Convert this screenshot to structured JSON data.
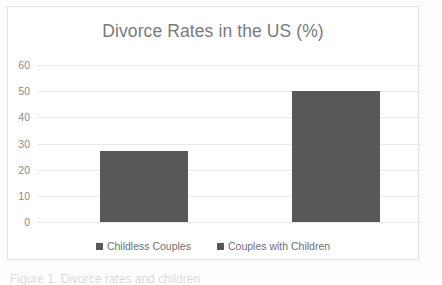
{
  "chart_data": {
    "type": "bar",
    "title": "Divorce Rates in the US (%)",
    "xlabel": "",
    "ylabel": "",
    "categories": [
      "Childless Couples",
      "Couples with Children"
    ],
    "values": [
      27,
      50
    ],
    "series": [
      {
        "name": "Divorce Rate",
        "values": [
          27,
          50
        ]
      }
    ],
    "ylim": [
      0,
      60
    ],
    "y_ticks": [
      0,
      10,
      20,
      30,
      40,
      50,
      60
    ],
    "y_tick_labels": [
      "0",
      "10",
      "20",
      "30",
      "40",
      "50",
      "60"
    ],
    "x_tick_labels": [],
    "grid": "horizontal",
    "legend_position": "bottom",
    "legend": [
      {
        "label": "Childless Couples",
        "color": "#585858"
      },
      {
        "label": "Couples with Children",
        "color": "#585858"
      }
    ],
    "colors": {
      "bar": "#585858",
      "gridline": "#e9e9e9",
      "title_text": "#7a7a7a",
      "tick_text": "#8a8a8a",
      "legend_text": "#6f6f6f",
      "frame_border": "#e2e2e2",
      "plot_background": "#ffffff"
    },
    "annotations": []
  },
  "page": {
    "bottom_artifact_text": "Figure 1. Divorce rates and children"
  }
}
